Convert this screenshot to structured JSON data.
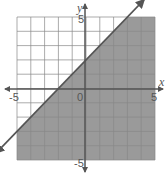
{
  "chart_data": {
    "type": "line",
    "title": "",
    "subtitle": "Graph of linear inequality y < x + 2 (shaded below boundary line)",
    "xlabel": "x",
    "ylabel": "y",
    "xlim": [
      -5,
      5
    ],
    "ylim": [
      -5,
      5
    ],
    "grid": true,
    "grid_step": 1,
    "x_ticks_labeled": [
      -5,
      0,
      5
    ],
    "y_ticks_labeled": [
      5,
      -5
    ],
    "tick_labels": {
      "x_neg": "-5",
      "origin": "0",
      "x_pos": "5",
      "y_pos": "5",
      "y_neg": "-5"
    },
    "series": [
      {
        "name": "boundary line",
        "equation": "y = x + 2",
        "slope": 1,
        "intercept": 2,
        "style": "solid",
        "arrows": "both ends",
        "x": [
          -6.5,
          -5,
          -2,
          0,
          3,
          4.2
        ],
        "y": [
          -4.5,
          -3,
          0,
          2,
          5,
          6.2
        ]
      }
    ],
    "shaded_region": {
      "description": "below the line",
      "inequality": "y < x + 2",
      "color": "#9a9a9a"
    },
    "colors": {
      "grid": "#888888",
      "line": "#555555",
      "shade": "#9a9a9a",
      "axis": "#555555"
    }
  }
}
